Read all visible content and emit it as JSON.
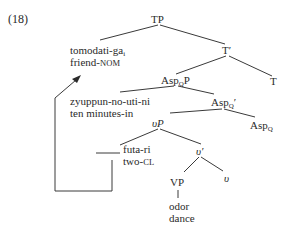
{
  "example_number": "(18)",
  "nodes": {
    "TP": "TP",
    "T_bar": "T′",
    "T": "T",
    "AspQP_base": "Asp",
    "AspQP_sub": "Q",
    "AspQP_suffix": "P",
    "AspQ_bar_base": "Asp",
    "AspQ_bar_sub": "Q",
    "AspQ_bar_suffix": "′",
    "AspQ_base": "Asp",
    "AspQ_sub": "Q",
    "vP": "υP",
    "v_bar": "υ′",
    "v": "υ",
    "VP": "VP"
  },
  "leaves": {
    "subject": {
      "word": "tomodati-ga",
      "index": "i",
      "gloss_main": "friend-",
      "gloss_sc": "NOM"
    },
    "adjunct": {
      "word": "zyuppun-no-uti-ni",
      "gloss": "ten minutes-in"
    },
    "quantifier": {
      "word": "futa-ri",
      "gloss_main": "two-",
      "gloss_sc": "CL"
    },
    "verb": {
      "word": "odor",
      "gloss": "dance"
    }
  },
  "colors": {
    "ink": "#2a2a2a",
    "background": "#ffffff"
  }
}
